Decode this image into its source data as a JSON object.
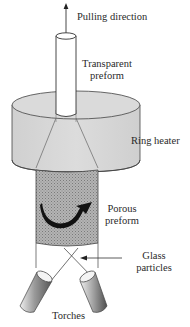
{
  "diagram": {
    "labels": {
      "pulling_direction": "Pulling direction",
      "transparent_preform_line1": "Transparent",
      "transparent_preform_line2": "preform",
      "ring_heater": "Ring heater",
      "porous_preform_line1": "Porous",
      "porous_preform_line2": "preform",
      "glass_particles_line1": "Glass",
      "glass_particles_line2": "particles",
      "torches": "Torches"
    },
    "components": [
      {
        "name": "transparent-preform",
        "shape": "cylinder"
      },
      {
        "name": "ring-heater",
        "shape": "cylinder"
      },
      {
        "name": "porous-preform",
        "shape": "textured cylinder"
      },
      {
        "name": "torch-left",
        "shape": "tilted cylinder"
      },
      {
        "name": "torch-right",
        "shape": "tilted cylinder"
      },
      {
        "name": "rotation-arrow",
        "shape": "curved arrow"
      },
      {
        "name": "pulling-arrow",
        "shape": "arrow up"
      },
      {
        "name": "glass-particles-arrow",
        "shape": "arrow left"
      }
    ],
    "colors": {
      "heater_fill": "#d9d9d9",
      "porous_fill": "#a8a8a8",
      "torch_dark": "#6a6a6a",
      "torch_light": "#e6e6e6",
      "line": "#333333"
    }
  }
}
